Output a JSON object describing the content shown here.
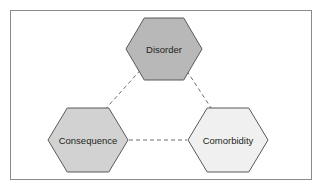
{
  "figure": {
    "type": "triangular-relationship-diagram",
    "background_color": "#ffffff",
    "frame": {
      "border_color": "#8a8a8a",
      "fill_color": "#ffffff"
    },
    "nodes": [
      {
        "id": "disorder",
        "label": "Disorder",
        "shape": "hexagon",
        "position": "top-center",
        "center_x": 164,
        "center_y": 49,
        "half_width": 38,
        "half_height": 31,
        "fill_color": "#b8b8b8",
        "stroke_color": "#595959",
        "label_color": "#231f20"
      },
      {
        "id": "consequence",
        "label": "Consequence",
        "shape": "hexagon",
        "position": "bottom-left",
        "center_x": 88,
        "center_y": 140,
        "half_width": 40,
        "half_height": 32,
        "fill_color": "#d2d2d2",
        "stroke_color": "#595959",
        "label_color": "#231f20"
      },
      {
        "id": "comorbidity",
        "label": "Comorbidity",
        "shape": "hexagon",
        "position": "bottom-right",
        "center_x": 228,
        "center_y": 140,
        "half_width": 40,
        "half_height": 32,
        "fill_color": "#f0f0f0",
        "stroke_color": "#595959",
        "label_color": "#231f20"
      }
    ],
    "connectors": [
      {
        "id": "disorder-consequence",
        "from": "disorder",
        "to": "consequence",
        "style": "dashed",
        "color": "#6e6e6e",
        "x1": 145,
        "y1": 65,
        "x2": 101,
        "y2": 114
      },
      {
        "id": "disorder-comorbidity",
        "from": "disorder",
        "to": "comorbidity",
        "style": "dashed",
        "color": "#6e6e6e",
        "x1": 183,
        "y1": 65,
        "x2": 215,
        "y2": 114
      },
      {
        "id": "consequence-comorbidity",
        "from": "consequence",
        "to": "comorbidity",
        "style": "dashed",
        "color": "#6e6e6e",
        "x1": 129,
        "y1": 140,
        "x2": 187,
        "y2": 140
      }
    ]
  }
}
